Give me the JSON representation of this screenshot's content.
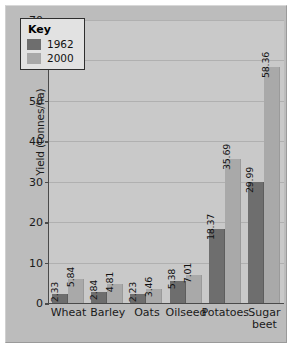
{
  "chart_data": {
    "type": "bar",
    "title": "",
    "xlabel": "",
    "ylabel": "Yield (tonnes/ha)",
    "ylim": [
      0,
      70
    ],
    "ytick_step": 10,
    "yticks": [
      "0",
      "10",
      "20",
      "30",
      "40",
      "50",
      "60",
      "70"
    ],
    "grid": true,
    "categories": [
      "Wheat",
      "Barley",
      "Oats",
      "Oilseed",
      "Potatoes",
      "Sugar\nbeet"
    ],
    "series": [
      {
        "name": "1962",
        "color": "#6e6e6e",
        "values": [
          2.33,
          2.84,
          2.23,
          5.38,
          18.37,
          29.99
        ]
      },
      {
        "name": "2000",
        "color": "#a9a9a9",
        "values": [
          5.84,
          4.81,
          3.46,
          7.01,
          35.69,
          58.36
        ]
      }
    ],
    "value_labels": [
      [
        "2.33",
        "5.84"
      ],
      [
        "2.84",
        "4.81"
      ],
      [
        "2.23",
        "3.46"
      ],
      [
        "5.38",
        "7.01"
      ],
      [
        "18.37",
        "35.69"
      ],
      [
        "29.99",
        "58.36"
      ]
    ],
    "legend": {
      "title": "Key",
      "position": "top-left",
      "entries": [
        {
          "label": "1962",
          "color": "#6e6e6e"
        },
        {
          "label": "2000",
          "color": "#a9a9a9"
        }
      ]
    },
    "colors": {
      "plot_background": "#c9c9c9",
      "board_background": "#bcbcbc",
      "axis": "#4a4a4a",
      "gridline": "#b0b0b0",
      "legend_background": "#e2e2e2",
      "text": "#1a1a1a"
    }
  }
}
